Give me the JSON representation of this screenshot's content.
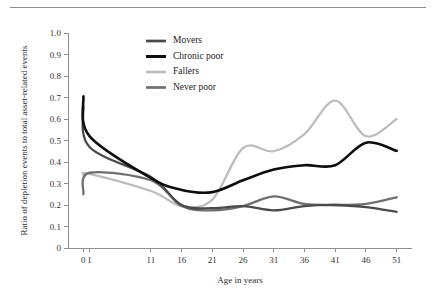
{
  "figure": {
    "has_top_rule": true
  },
  "chart_data": {
    "type": "line",
    "title": "",
    "xlabel": "Age in years",
    "ylabel": "Ratio of depletion events to total asset-related events",
    "x_tick_labels": [
      "0",
      "1",
      "11",
      "16",
      "21",
      "26",
      "31",
      "36",
      "41",
      "46",
      "51"
    ],
    "x_tick_values": [
      0,
      1,
      11,
      16,
      21,
      26,
      31,
      36,
      41,
      46,
      51
    ],
    "y_tick_labels": [
      "0",
      "0.1",
      "0.2",
      "0.3",
      "0.4",
      "0.5",
      "0.6",
      "0.7",
      "0.8",
      "0.9",
      "1.0"
    ],
    "y_tick_values": [
      0,
      0.1,
      0.2,
      0.3,
      0.4,
      0.5,
      0.6,
      0.7,
      0.8,
      0.9,
      1.0
    ],
    "xlim": [
      -2.5,
      53.5
    ],
    "ylim": [
      0,
      1.0
    ],
    "grid": false,
    "legend_position": "top-center-left",
    "x": [
      0,
      1,
      11,
      16,
      21,
      26,
      31,
      36,
      41,
      46,
      51
    ],
    "series": [
      {
        "name": "Movers",
        "color": "#4a4a4a",
        "width": 2.3,
        "values": [
          0.66,
          0.47,
          0.33,
          0.2,
          0.185,
          0.195,
          0.175,
          0.195,
          0.2,
          0.19,
          0.168
        ]
      },
      {
        "name": "Chronic poor",
        "color": "#0d0d0d",
        "width": 2.6,
        "values": [
          0.705,
          0.52,
          0.325,
          0.27,
          0.26,
          0.315,
          0.365,
          0.385,
          0.385,
          0.49,
          0.452
        ]
      },
      {
        "name": "Fallers",
        "color": "#bdbdbd",
        "width": 2.3,
        "values": [
          0.34,
          0.345,
          0.265,
          0.195,
          0.225,
          0.465,
          0.45,
          0.53,
          0.685,
          0.52,
          0.6
        ]
      },
      {
        "name": "Never poor",
        "color": "#6f6f6f",
        "width": 2.3,
        "values": [
          0.25,
          0.35,
          0.315,
          0.195,
          0.175,
          0.195,
          0.24,
          0.205,
          0.2,
          0.205,
          0.236
        ]
      }
    ],
    "legend": [
      {
        "label": "Movers",
        "color": "#4a4a4a"
      },
      {
        "label": "Chronic poor",
        "color": "#0d0d0d"
      },
      {
        "label": "Fallers",
        "color": "#bdbdbd"
      },
      {
        "label": "Never poor",
        "color": "#6f6f6f"
      }
    ]
  }
}
